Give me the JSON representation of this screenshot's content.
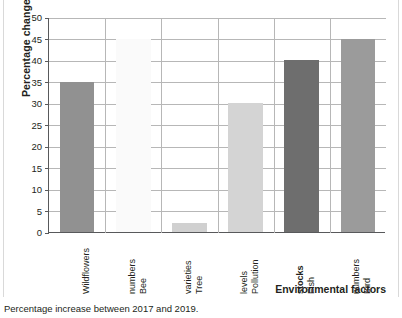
{
  "chart_data": {
    "type": "bar",
    "title": "",
    "xlabel": "Environmental factors",
    "ylabel": "Percentage change",
    "categories": [
      "Wildflowers",
      "Bee numbers",
      "Tree varieties",
      "Pollution levels",
      "Fish stocks",
      "Bird numbers"
    ],
    "category_lines": [
      [
        "Wildflowers"
      ],
      [
        "Bee",
        "numbers"
      ],
      [
        "Tree",
        "varieties"
      ],
      [
        "Pollution",
        "levels"
      ],
      [
        "Fish",
        "stocks"
      ],
      [
        "Bird",
        "numbers"
      ]
    ],
    "values": [
      35,
      45,
      2,
      30,
      40,
      45
    ],
    "bar_colors": [
      "#919191",
      "#fafafa",
      "#d0d0d0",
      "#d4d4d4",
      "#6e6e6e",
      "#9b9b9b"
    ],
    "ylim": [
      0,
      50
    ],
    "ytick_labels": [
      "0",
      "5",
      "10",
      "15",
      "20",
      "25",
      "30",
      "35",
      "40",
      "45",
      "50"
    ],
    "ytick_values": [
      0,
      5,
      10,
      15,
      20,
      25,
      30,
      35,
      40,
      45,
      50
    ],
    "grid": "horizontal-and-vertical",
    "legend": "none",
    "caption": "Percentage increase between 2017 and 2019."
  },
  "figure": {
    "caption": "Percentage increase between 2017 and 2019.",
    "axis_color": "#58595b",
    "grid_color": "#b7b7b7"
  }
}
